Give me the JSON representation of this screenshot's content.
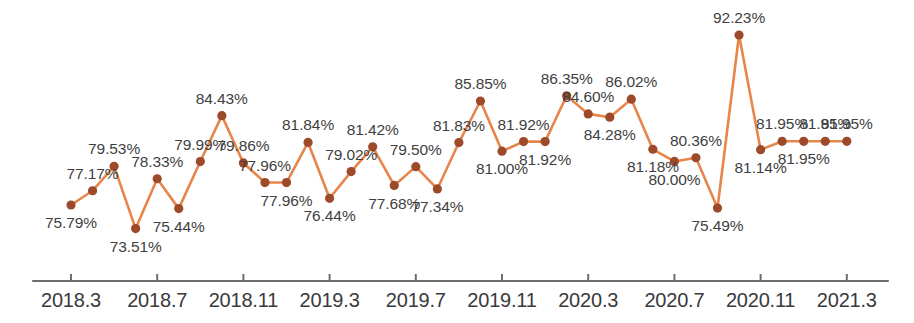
{
  "chart_data": {
    "type": "line",
    "title": "",
    "subtitle": "",
    "xlabel": "",
    "ylabel": "",
    "grid": false,
    "legend": "none",
    "axis": {
      "x_axis_visible": true,
      "y_axis_visible": false,
      "ylim": [
        73.0,
        93.5
      ],
      "value_suffix": "%"
    },
    "colors": {
      "line": "#e8854a",
      "marker": "#9c4a2a",
      "label_text": "#3f3f42",
      "axis": "#6e6e70",
      "background": "#ffffff"
    },
    "x_tick_labels": [
      "2018.3",
      "2018.7",
      "2018.11",
      "2019.3",
      "2019.7",
      "2019.11",
      "2020.3",
      "2020.7",
      "2020.11",
      "2021.3"
    ],
    "x": [
      "2018.3",
      "2018.4",
      "2018.5",
      "2018.6",
      "2018.7",
      "2018.8",
      "2018.9",
      "2018.10",
      "2018.11",
      "2018.12",
      "2019.1",
      "2019.2",
      "2019.3",
      "2019.4",
      "2019.5",
      "2019.6",
      "2019.7",
      "2019.8",
      "2019.9",
      "2019.10",
      "2019.11",
      "2019.12",
      "2020.1",
      "2020.2",
      "2020.3",
      "2020.4",
      "2020.5",
      "2020.6",
      "2020.7",
      "2020.8",
      "2020.9",
      "2020.10",
      "2020.11",
      "2020.12",
      "2021.1",
      "2021.2",
      "2021.3"
    ],
    "values": [
      75.79,
      77.17,
      79.53,
      73.51,
      78.33,
      75.44,
      79.99,
      84.43,
      79.86,
      77.96,
      77.96,
      81.84,
      76.44,
      79.02,
      81.42,
      77.68,
      79.5,
      77.34,
      81.83,
      85.85,
      81.0,
      81.92,
      81.92,
      86.35,
      84.6,
      84.28,
      86.02,
      81.18,
      80.0,
      80.36,
      75.49,
      92.23,
      81.14,
      81.95,
      81.95,
      81.95,
      81.95
    ],
    "point_labels": [
      "75.79%",
      "77.17%",
      "79.53%",
      "73.51%",
      "78.33%",
      "75.44%",
      "79.99%",
      "84.43%",
      "79.86%",
      "77.96%",
      "77.96%",
      "81.84%",
      "76.44%",
      "79.02%",
      "81.42%",
      "77.68%",
      "79.50%",
      "77.34%",
      "81.83%",
      "85.85%",
      "81.00%",
      "81.92%",
      "81.92%",
      "86.35%",
      "84.60%",
      "84.28%",
      "86.02%",
      "81.18%",
      "80.00%",
      "80.36%",
      "75.49%",
      "92.23%",
      "81.14%",
      "81.95%",
      "81.95%",
      "81.95%",
      "81.95%"
    ],
    "label_placement": [
      "below",
      "above",
      "above",
      "below",
      "above",
      "below",
      "above",
      "above",
      "above",
      "above",
      "below",
      "above",
      "below",
      "above",
      "above",
      "below",
      "above",
      "below",
      "above",
      "above",
      "below",
      "above",
      "below",
      "above",
      "above",
      "below",
      "above",
      "below",
      "below",
      "above",
      "below",
      "above",
      "below",
      "above",
      "below",
      "above",
      "above"
    ]
  }
}
